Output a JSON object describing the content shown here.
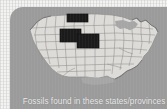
{
  "figure": {
    "caption": "Fossils found in these states/provinces",
    "panel_color": "#9b9b9b",
    "background_color": "#f3f3f2",
    "caption_text_color": "#ececec"
  },
  "map": {
    "title": "United States outline map with state borders",
    "land_color": "#dddbd7",
    "border_color": "#8d8d8d",
    "highlight_color": "#1b1b1b",
    "water_color": "#a6a6a6",
    "highlighted_regions": [
      "South Dakota",
      "Wyoming",
      "Colorado"
    ],
    "highlight_count": "3"
  }
}
